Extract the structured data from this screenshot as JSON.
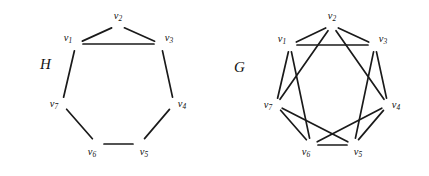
{
  "figure": {
    "background_color": "#ffffff",
    "stroke_color": "#1a1a1a",
    "width": 429,
    "height": 176
  },
  "graphs": [
    {
      "id": "H",
      "name": "graph-h",
      "label": "H",
      "label_position": {
        "x": 40,
        "y": 69
      },
      "center": {
        "x": 118,
        "y": 90
      },
      "radius_x": 57,
      "radius_y": 62,
      "vertex_count": 7,
      "edge_count": 8,
      "description": "seven-cycle with one chord",
      "vertices": [
        {
          "id": "v1",
          "label": "v",
          "sub": "1",
          "x": 76,
          "y": 44,
          "label_x": 68,
          "label_y": 41
        },
        {
          "id": "v2",
          "label": "v",
          "sub": "2",
          "x": 118,
          "y": 25,
          "label_x": 118,
          "label_y": 19
        },
        {
          "id": "v3",
          "label": "v",
          "sub": "3",
          "x": 161,
          "y": 44,
          "label_x": 169,
          "label_y": 41
        },
        {
          "id": "v4",
          "label": "v",
          "sub": "4",
          "x": 174,
          "y": 104,
          "label_x": 182,
          "label_y": 107
        },
        {
          "id": "v5",
          "label": "v",
          "sub": "5",
          "x": 140,
          "y": 144,
          "label_x": 144,
          "label_y": 155
        },
        {
          "id": "v6",
          "label": "v",
          "sub": "6",
          "x": 97,
          "y": 144,
          "label_x": 92,
          "label_y": 155
        },
        {
          "id": "v7",
          "label": "v",
          "sub": "7",
          "x": 62,
          "y": 104,
          "label_x": 54,
          "label_y": 107
        }
      ],
      "edges": [
        {
          "from": "v1",
          "to": "v2"
        },
        {
          "from": "v2",
          "to": "v3"
        },
        {
          "from": "v3",
          "to": "v4"
        },
        {
          "from": "v4",
          "to": "v5"
        },
        {
          "from": "v5",
          "to": "v6"
        },
        {
          "from": "v6",
          "to": "v7"
        },
        {
          "from": "v7",
          "to": "v1"
        },
        {
          "from": "v1",
          "to": "v3"
        }
      ]
    },
    {
      "id": "G",
      "name": "graph-g",
      "label": "G",
      "label_position": {
        "x": 234,
        "y": 72
      },
      "center": {
        "x": 332,
        "y": 90
      },
      "radius_x": 57,
      "radius_y": 62,
      "vertex_count": 7,
      "edge_count": 14,
      "description": "circulant graph on seven vertices with chords at distance one and two",
      "vertices": [
        {
          "id": "v1",
          "label": "v",
          "sub": "1",
          "x": 290,
          "y": 45,
          "label_x": 282,
          "label_y": 42
        },
        {
          "id": "v2",
          "label": "v",
          "sub": "2",
          "x": 332,
          "y": 25,
          "label_x": 332,
          "label_y": 19
        },
        {
          "id": "v3",
          "label": "v",
          "sub": "3",
          "x": 375,
          "y": 45,
          "label_x": 383,
          "label_y": 42
        },
        {
          "id": "v4",
          "label": "v",
          "sub": "4",
          "x": 388,
          "y": 105,
          "label_x": 396,
          "label_y": 108
        },
        {
          "id": "v5",
          "label": "v",
          "sub": "5",
          "x": 354,
          "y": 145,
          "label_x": 358,
          "label_y": 155
        },
        {
          "id": "v6",
          "label": "v",
          "sub": "6",
          "x": 311,
          "y": 145,
          "label_x": 306,
          "label_y": 155
        },
        {
          "id": "v7",
          "label": "v",
          "sub": "7",
          "x": 276,
          "y": 105,
          "label_x": 268,
          "label_y": 108
        }
      ],
      "edges": [
        {
          "from": "v1",
          "to": "v2"
        },
        {
          "from": "v2",
          "to": "v3"
        },
        {
          "from": "v3",
          "to": "v4"
        },
        {
          "from": "v4",
          "to": "v5"
        },
        {
          "from": "v5",
          "to": "v6"
        },
        {
          "from": "v6",
          "to": "v7"
        },
        {
          "from": "v7",
          "to": "v1"
        },
        {
          "from": "v1",
          "to": "v3"
        },
        {
          "from": "v2",
          "to": "v4"
        },
        {
          "from": "v3",
          "to": "v5"
        },
        {
          "from": "v4",
          "to": "v6"
        },
        {
          "from": "v5",
          "to": "v7"
        },
        {
          "from": "v6",
          "to": "v1"
        },
        {
          "from": "v7",
          "to": "v2"
        }
      ]
    }
  ]
}
